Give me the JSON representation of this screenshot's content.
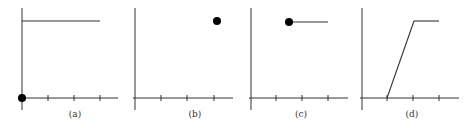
{
  "panels": [
    {
      "id": "a",
      "label": "(a)",
      "yaxis_x": 22,
      "xaxis_end": 118,
      "ticks": [
        48,
        74,
        100
      ],
      "label_x": 75,
      "segments": [
        [
          22,
          21,
          100,
          21
        ]
      ],
      "dots": [
        [
          22,
          98
        ]
      ]
    },
    {
      "id": "b",
      "label": "(b)",
      "yaxis_x": 135,
      "xaxis_end": 233,
      "ticks": [
        161,
        187,
        214
      ],
      "label_x": 195,
      "segments": [],
      "dots": [
        [
          217,
          21
        ]
      ]
    },
    {
      "id": "c",
      "label": "(c)",
      "yaxis_x": 251,
      "xaxis_end": 348,
      "ticks": [
        276,
        302,
        328
      ],
      "label_x": 301,
      "segments": [
        [
          289,
          22,
          328,
          22
        ]
      ],
      "dots": [
        [
          289,
          22
        ]
      ]
    },
    {
      "id": "d",
      "label": "(d)",
      "yaxis_x": 362,
      "xaxis_end": 459,
      "ticks": [
        387,
        413,
        439
      ],
      "label_x": 412,
      "segments": [
        [
          387,
          98,
          414,
          21
        ],
        [
          414,
          21,
          439,
          21
        ]
      ],
      "dots": []
    }
  ],
  "style": {
    "stroke": "#333333",
    "dot": "#000000"
  }
}
